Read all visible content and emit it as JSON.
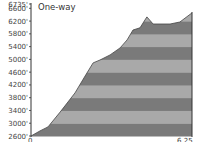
{
  "chart_data": {
    "type": "area",
    "title": "One-way",
    "xlabel": "",
    "ylabel": "",
    "x_tick_labels": [
      "0",
      "6.25"
    ],
    "y_tick_labels": [
      "6735'",
      "6600'",
      "6200'",
      "5800'",
      "5400'",
      "5000'",
      "4600'",
      "4200'",
      "3800'",
      "3400'",
      "3000'",
      "2600'"
    ],
    "xlim": [
      0,
      6.25
    ],
    "ylim": [
      2600,
      6735
    ],
    "grid": false,
    "bands": "alternating gray horizontal stripes every 400 ft",
    "x": [
      0,
      0.35,
      0.66,
      1.13,
      1.71,
      2.1,
      2.41,
      2.68,
      3.07,
      3.46,
      3.73,
      3.96,
      4.23,
      4.5,
      4.74,
      5.4,
      5.78,
      6.25
    ],
    "values": [
      2600,
      2760,
      2885,
      3350,
      3950,
      4480,
      4890,
      4980,
      5140,
      5360,
      5610,
      5920,
      5990,
      6330,
      6110,
      6110,
      6170,
      6455
    ]
  },
  "labels": {
    "title": "One-way",
    "x_start": "0",
    "x_end": "6.25"
  },
  "colors": {
    "band_dark": "#7a7a7a",
    "band_light": "#a9a9a9",
    "axis": "#333333"
  }
}
